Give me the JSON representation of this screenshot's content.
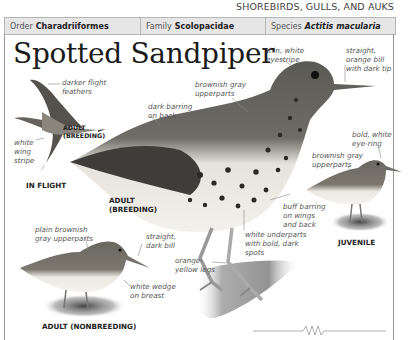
{
  "section": "SHOREBIRDS, GULLS, AND AUKS",
  "taxonomy": {
    "order_label": "Order",
    "order_value": "Charadriiformes",
    "family_label": "Family",
    "family_value": "Scolopacidae",
    "species_label": "Species",
    "species_value": "Actitis macularia"
  },
  "title": "Spotted Sandpiper",
  "captions": {
    "in_flight": "IN FLIGHT",
    "flight_adult_line1": "ADULT",
    "flight_adult_line2": "(BREEDING)",
    "main_adult_line1": "ADULT",
    "main_adult_line2": "(BREEDING)",
    "juvenile": "JUVENILE",
    "nonbreeding": "ADULT (NONBREEDING)"
  },
  "labels": {
    "darker_flight_1": "darker flight",
    "darker_flight_2": "feathers",
    "wing_stripe_1": "white",
    "wing_stripe_2": "wing",
    "wing_stripe_3": "stripe",
    "eyestripe_1": "thin, white",
    "eyestripe_2": "eyestripe",
    "bill_1": "straight,",
    "bill_2": "orange bill",
    "bill_3": "with dark tip",
    "upper_1": "brownish gray",
    "upper_2": "upperparts",
    "barring_1": "dark barring",
    "barring_2": "on back",
    "eyering_1": "bold, white",
    "eyering_2": "eye-ring",
    "juv_upper_1": "brownish gray",
    "juv_upper_2": "upperparts",
    "buff_1": "buff barring",
    "buff_2": "on wings",
    "buff_3": "and back",
    "under_1": "white underparts",
    "under_2": "with bold, dark",
    "under_3": "spots",
    "legs_1": "orange-",
    "legs_2": "yellow legs",
    "nb_upper_1": "plain brownish",
    "nb_upper_2": "gray upperparts",
    "nb_bill_1": "straight,",
    "nb_bill_2": "dark bill",
    "wedge_1": "white wedge",
    "wedge_2": "on breast"
  }
}
